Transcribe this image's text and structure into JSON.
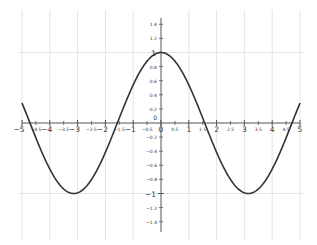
{
  "chart_data": {
    "type": "line",
    "title": "",
    "xlabel": "",
    "ylabel": "",
    "xlim": [
      -5,
      5
    ],
    "ylim": [
      -1.5,
      1.5
    ],
    "grid": true,
    "legend": null,
    "series": [
      {
        "name": "cos(x)",
        "function": "cos(x)",
        "x": [
          -5,
          -4.5,
          -4,
          -3.5,
          -3,
          -2.5,
          -2,
          -1.5,
          -1,
          -0.5,
          0,
          0.5,
          1,
          1.5,
          2,
          2.5,
          3,
          3.5,
          4,
          4.5,
          5
        ],
        "y": [
          0.28,
          -0.21,
          -0.65,
          -0.94,
          -0.99,
          -0.8,
          -0.42,
          0.07,
          0.54,
          0.88,
          1.0,
          0.88,
          0.54,
          0.07,
          -0.42,
          -0.8,
          -0.99,
          -0.94,
          -0.65,
          -0.21,
          0.28
        ],
        "color": "#333333"
      }
    ],
    "x_major_ticks": [
      "-5",
      "-4",
      "-3",
      "-2",
      "-1",
      "0",
      "1",
      "2",
      "3",
      "4",
      "5"
    ],
    "x_minor_ticks": [
      "-4.5",
      "-3.5",
      "-2.5",
      "-1.5",
      "-0.5",
      "0.5",
      "1.5",
      "2.5",
      "3.5",
      "4.5"
    ],
    "y_major_ticks": [
      "-1",
      "1"
    ],
    "y_minor_ticks": [
      "1.4",
      "1.2",
      "0.8",
      "0.6",
      "0.4",
      "0.2",
      "-0.2",
      "-0.4",
      "-0.6",
      "-0.8",
      "-1.2",
      "-1.4"
    ],
    "origin_label": "0"
  },
  "colors": {
    "curve": "#333333",
    "axis": "#555555",
    "grid": "#dddddd",
    "label": "#333333"
  }
}
